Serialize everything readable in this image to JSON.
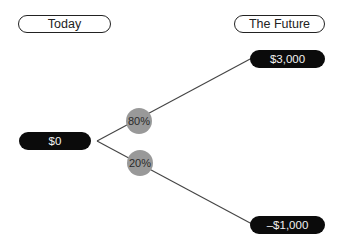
{
  "headers": {
    "today": "Today",
    "future": "The Future"
  },
  "root": {
    "value": "$0"
  },
  "branches": [
    {
      "probability": "80%",
      "outcome": "$3,000"
    },
    {
      "probability": "20%",
      "outcome": "–$1,000"
    }
  ],
  "colors": {
    "node_fill": "#0b0b0b",
    "node_text": "#f2f2f2",
    "probability_fill": "#999999",
    "line": "#444444"
  }
}
